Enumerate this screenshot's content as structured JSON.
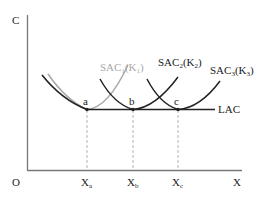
{
  "diagram": {
    "type": "cost-curves",
    "axes": {
      "y_label": "C",
      "x_label": "X",
      "origin_label": "O"
    },
    "x_ticks": [
      {
        "label": "X",
        "sub": "a"
      },
      {
        "label": "X",
        "sub": "b"
      },
      {
        "label": "X",
        "sub": "c"
      }
    ],
    "points": [
      {
        "label": "a"
      },
      {
        "label": "b"
      },
      {
        "label": "c"
      }
    ],
    "curves": [
      {
        "name": "SAC1",
        "main": "SAC",
        "sub1": "1",
        "paren": "(K",
        "sub2": "1",
        "close": ")",
        "color": "#a8a8a8"
      },
      {
        "name": "SAC2",
        "main": "SAC",
        "sub1": "2",
        "paren": "(K",
        "sub2": "2",
        "close": ")",
        "color": "#222222"
      },
      {
        "name": "SAC3",
        "main": "SAC",
        "sub1": "3",
        "paren": "(K",
        "sub2": "3",
        "close": ")",
        "color": "#222222"
      },
      {
        "name": "LAC",
        "label": "LAC",
        "color": "#222222"
      }
    ],
    "colors": {
      "axis": "#555555",
      "curve": "#222222",
      "sac1": "#a8a8a8",
      "guide": "#999999"
    }
  }
}
